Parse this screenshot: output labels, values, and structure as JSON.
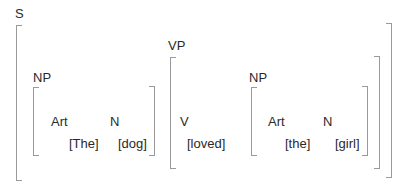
{
  "diagram": {
    "type": "labeled-bracketing",
    "sentence": "The dog loved the girl",
    "nodes": {
      "S": {
        "label": "S"
      },
      "NP_subject": {
        "label": "NP",
        "art": {
          "label": "Art",
          "word": "[The]"
        },
        "n": {
          "label": "N",
          "word": "[dog]"
        }
      },
      "VP": {
        "label": "VP",
        "v": {
          "label": "V",
          "word": "[loved]"
        }
      },
      "NP_object": {
        "label": "NP",
        "art": {
          "label": "Art",
          "word": "[the]"
        },
        "n": {
          "label": "N",
          "word": "[girl]"
        }
      }
    },
    "colors": {
      "text": "#2a2a2a",
      "bracket": "#9a9a9a",
      "background": "#ffffff"
    }
  }
}
